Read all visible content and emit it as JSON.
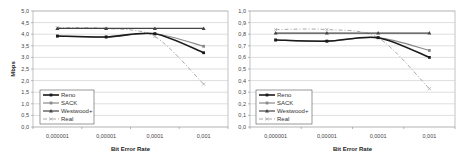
{
  "chart_data": [
    {
      "type": "line",
      "title": "",
      "xlabel": "Bit Error Rate",
      "ylabel": "Mbps",
      "categories": [
        "0,000001",
        "0,00001",
        "0,0001",
        "0,001"
      ],
      "ylim": [
        0,
        5
      ],
      "yticks": [
        "0,0",
        "0,5",
        "1,0",
        "1,5",
        "2,0",
        "2,5",
        "3,0",
        "3,5",
        "4,0",
        "4,5",
        "5,0"
      ],
      "grid": true,
      "legend_position": "lower-left inside",
      "series": [
        {
          "name": "Reno",
          "values": [
            3.92,
            3.88,
            4.02,
            3.2
          ]
        },
        {
          "name": "SACK",
          "values": [
            3.92,
            3.88,
            4.02,
            3.48
          ]
        },
        {
          "name": "Westwood+",
          "values": [
            4.25,
            4.25,
            4.25,
            4.25
          ]
        },
        {
          "name": "Real",
          "values": [
            4.28,
            4.25,
            3.9,
            1.85
          ]
        }
      ]
    },
    {
      "type": "line",
      "title": "",
      "xlabel": "Bit Error Rate",
      "ylabel": "",
      "categories": [
        "0,000001",
        "0,00001",
        "0,0001",
        "0,001"
      ],
      "ylim": [
        0,
        1
      ],
      "yticks": [
        "0,0",
        "0,1",
        "0,2",
        "0,3",
        "0,4",
        "0,5",
        "0,6",
        "0,7",
        "0,8",
        "0,9",
        "1,0"
      ],
      "grid": true,
      "legend_position": "lower-left inside",
      "series": [
        {
          "name": "Reno",
          "values": [
            0.75,
            0.74,
            0.77,
            0.6
          ]
        },
        {
          "name": "SACK",
          "values": [
            0.75,
            0.74,
            0.77,
            0.66
          ]
        },
        {
          "name": "Westwood+",
          "values": [
            0.81,
            0.81,
            0.81,
            0.81
          ]
        },
        {
          "name": "Real",
          "values": [
            0.84,
            0.84,
            0.77,
            0.33
          ]
        }
      ]
    }
  ],
  "styles": {
    "Reno": {
      "color": "#1a1a1a",
      "width": 1.6,
      "dash": "",
      "marker": "square"
    },
    "SACK": {
      "color": "#8a8a8a",
      "width": 1.2,
      "dash": "",
      "marker": "square"
    },
    "Westwood+": {
      "color": "#444444",
      "width": 1.2,
      "dash": "",
      "marker": "triangle"
    },
    "Real": {
      "color": "#aaaaaa",
      "width": 1.0,
      "dash": "4,2,1,2",
      "marker": "x"
    }
  },
  "colors": {
    "grid": "#c8c8c8",
    "frame": "#999999"
  }
}
